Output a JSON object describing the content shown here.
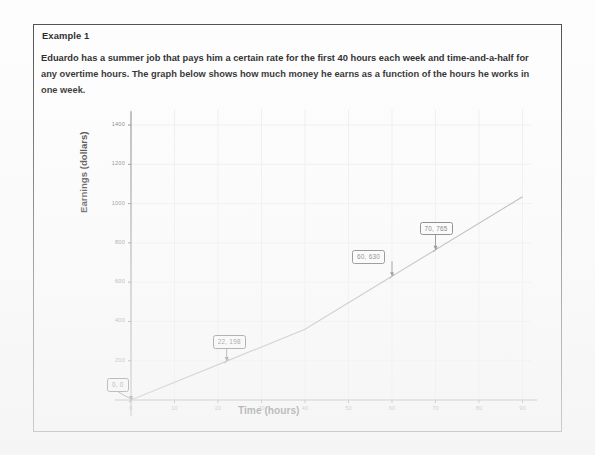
{
  "document": {
    "example_title": "Example 1",
    "prompt": "Eduardo has a summer job that pays him a certain rate for the first 40 hours each week and time-and-a-half for any overtime hours.  The graph below shows how much money he earns as a function of the hours he works in one week."
  },
  "chart_data": {
    "type": "line",
    "title": "",
    "xlabel": "Time (hours)",
    "ylabel": "Earnings (dollars)",
    "xlim": [
      0,
      92
    ],
    "ylim": [
      0,
      1480
    ],
    "xticks": [
      0,
      10,
      20,
      30,
      40,
      50,
      60,
      70,
      80,
      90
    ],
    "yticks": [
      200,
      400,
      600,
      800,
      1000,
      1200,
      1400
    ],
    "grid": true,
    "legend": null,
    "series": [
      {
        "name": "Earnings",
        "x": [
          0,
          22,
          40,
          60,
          70,
          90
        ],
        "y": [
          0,
          198,
          360,
          630,
          765,
          1035
        ]
      }
    ],
    "annotations": [
      {
        "label": "0, 0",
        "x": 0,
        "y": 0
      },
      {
        "label": "22, 198",
        "x": 22,
        "y": 198
      },
      {
        "label": "60, 630",
        "x": 60,
        "y": 630
      },
      {
        "label": "70, 765",
        "x": 70,
        "y": 765
      }
    ],
    "colors": {
      "line": "#9a9a9a",
      "axis": "#7a7a7a",
      "grid": "#ededed",
      "tick_text": "#6d6d6d",
      "callout_border": "#3d3d3d",
      "page_border": "#4a4a4a"
    }
  }
}
